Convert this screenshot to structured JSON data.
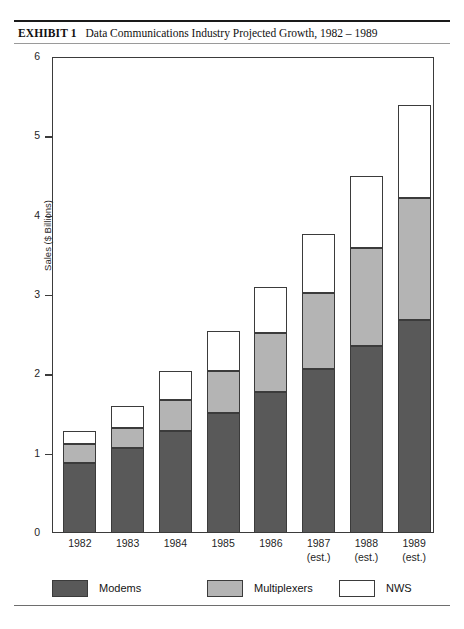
{
  "exhibit": {
    "label": "EXHIBIT 1",
    "title": "Data Communications Industry Projected Growth, 1982 – 1989"
  },
  "colors": {
    "modems": "#595959",
    "multiplexers": "#b4b4b4",
    "nws": "#ffffff",
    "outline": "#3b3b3b",
    "rule": "#1a1a1a"
  },
  "legend": {
    "items": [
      {
        "label": "Modems",
        "color": "#595959"
      },
      {
        "label": "Multiplexers",
        "color": "#b4b4b4"
      },
      {
        "label": "NWS",
        "color": "#ffffff"
      }
    ]
  },
  "axis": {
    "y_title": "Sales ($ Billions)",
    "y_ticks": [
      "0",
      "1",
      "2",
      "3",
      "4",
      "5",
      "6"
    ],
    "x_ticks": [
      {
        "year": "1982",
        "note": ""
      },
      {
        "year": "1983",
        "note": ""
      },
      {
        "year": "1984",
        "note": ""
      },
      {
        "year": "1985",
        "note": ""
      },
      {
        "year": "1986",
        "note": ""
      },
      {
        "year": "1987",
        "note": "(est.)"
      },
      {
        "year": "1988",
        "note": "(est.)"
      },
      {
        "year": "1989",
        "note": "(est.)"
      }
    ]
  },
  "chart_data": {
    "type": "bar",
    "stacked": true,
    "title": "Data Communications Industry Projected Growth, 1982 – 1989",
    "xlabel": "",
    "ylabel": "Sales ($ Billions)",
    "ylim": [
      0,
      6
    ],
    "ytick_step": 1,
    "grid": false,
    "legend_position": "bottom",
    "categories": [
      "1982",
      "1983",
      "1984",
      "1985",
      "1986",
      "1987 (est.)",
      "1988 (est.)",
      "1989 (est.)"
    ],
    "series": [
      {
        "name": "Modems",
        "color": "#595959",
        "values": [
          0.88,
          1.07,
          1.28,
          1.51,
          1.78,
          2.07,
          2.36,
          2.68
        ]
      },
      {
        "name": "Multiplexers",
        "color": "#b4b4b4",
        "values": [
          0.24,
          0.25,
          0.4,
          0.53,
          0.74,
          0.96,
          1.23,
          1.54
        ]
      },
      {
        "name": "NWS",
        "color": "#ffffff",
        "values": [
          0.16,
          0.28,
          0.36,
          0.51,
          0.58,
          0.74,
          0.91,
          1.18
        ]
      }
    ],
    "totals": [
      1.28,
      1.6,
      2.04,
      2.55,
      3.1,
      3.77,
      4.5,
      5.4
    ]
  }
}
